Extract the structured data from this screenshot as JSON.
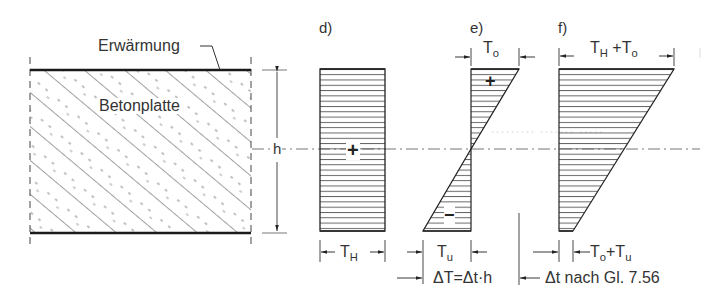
{
  "figure": {
    "slab": {
      "heating_label": "Erwärmung",
      "material_label": "Betonplatte",
      "height_label": "h"
    },
    "panels": [
      {
        "id": "d",
        "label": "d)",
        "shape": "rectangle",
        "sign": "+",
        "bottom_dimension": {
          "main": "T",
          "sub": "H"
        }
      },
      {
        "id": "e",
        "label": "e)",
        "shape": "antisymmetric-triangles",
        "top_dimension": {
          "main": "T",
          "sub": "o"
        },
        "top_sign": "+",
        "bottom_sign": "−",
        "bottom_dimension": {
          "main": "T",
          "sub": "u"
        },
        "total_dimension": "ΔT=Δt·h"
      },
      {
        "id": "f",
        "label": "f)",
        "shape": "trapezoid",
        "top_dimension": {
          "a": "T",
          "a_sub": "H",
          "plus": "+",
          "b": "T",
          "b_sub": "o"
        },
        "bottom_dimension": {
          "a": "T",
          "a_sub": "o",
          "plus": "+",
          "b": "T",
          "b_sub": "u"
        },
        "note": "Δt nach Gl. 7.56"
      }
    ]
  },
  "colors": {
    "line": "#2a2a2a",
    "hatch": "#555555",
    "text": "#333333"
  }
}
